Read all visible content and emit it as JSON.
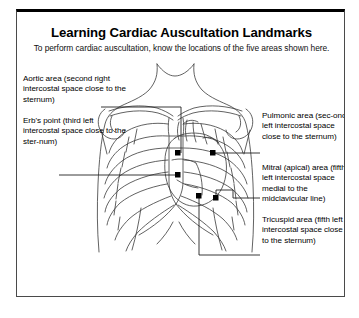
{
  "card": {
    "title": "Learning Cardiac Auscultation Landmarks",
    "subtitle": "To perform cardiac auscultation, know the locations of the five areas shown here."
  },
  "labels": {
    "aortic": "Aortic area (second right intercostal space close to the sternum)",
    "erbs": "Erb's point (third left intercostal space close to the ster-num)",
    "pulmonic": "Pulmonic area (sec-ond left intercostal space close to the sternum)",
    "mitral": "Mitral (apical) area (fifth left intercostal space medial to the midclavicular line)",
    "tricuspid": "Tricuspid area (fifth left intercostal space close to the sternum)"
  },
  "illustration": {
    "name": "anterior-chest-auscultation-diagram",
    "marker_count": 5,
    "markers": [
      {
        "name": "aortic-marker",
        "x": 161,
        "y": 141
      },
      {
        "name": "pulmonic-marker",
        "x": 196,
        "y": 141
      },
      {
        "name": "erbs-marker",
        "x": 161,
        "y": 163
      },
      {
        "name": "mitral-marker",
        "x": 199,
        "y": 186
      },
      {
        "name": "tricuspid-marker",
        "x": 182,
        "y": 184
      }
    ]
  },
  "colors": {
    "border": "#4a4a4a",
    "border_top": "#000000",
    "ink": "#000000",
    "line": "#333333",
    "paper": "#ffffff"
  }
}
